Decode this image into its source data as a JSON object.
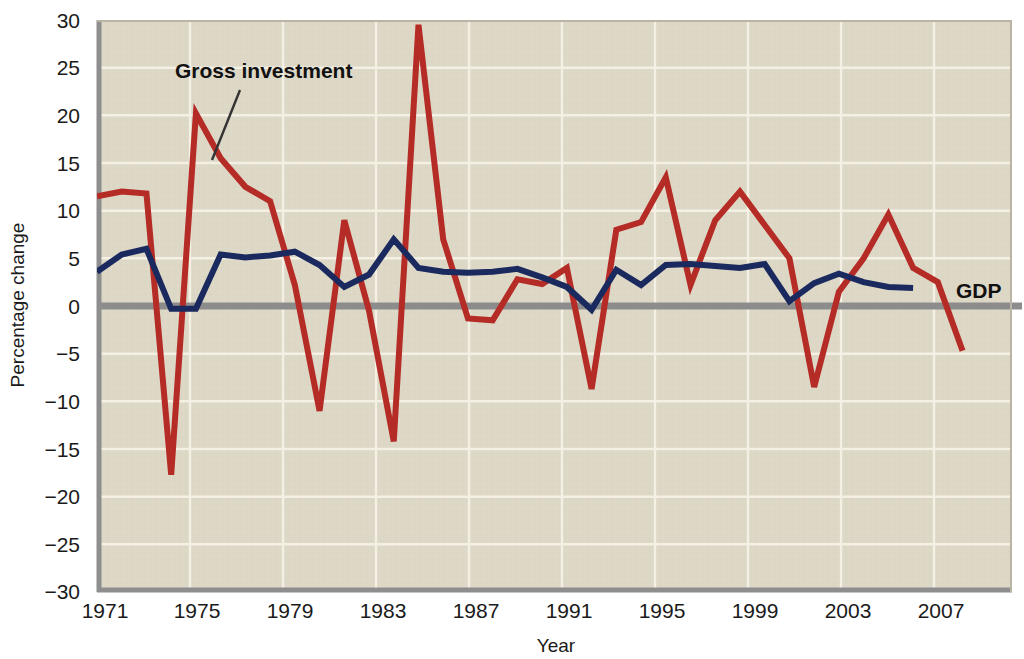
{
  "chart_data": {
    "type": "line",
    "title": "",
    "xlabel": "Year",
    "ylabel": "Percentage change",
    "xlim": [
      1971,
      2008
    ],
    "ylim": [
      -30,
      30
    ],
    "grid": true,
    "legend_position": "inline-annotations",
    "x_ticks": [
      "1971",
      "1975",
      "1979",
      "1983",
      "1987",
      "1991",
      "1995",
      "1999",
      "2003",
      "2007"
    ],
    "y_ticks": [
      "30",
      "25",
      "20",
      "15",
      "10",
      "5",
      "0",
      "−5",
      "−10",
      "−15",
      "−20",
      "−25",
      "−30"
    ],
    "x": [
      1971,
      1972,
      1973,
      1974,
      1975,
      1976,
      1977,
      1978,
      1979,
      1980,
      1981,
      1982,
      1983,
      1984,
      1985,
      1986,
      1987,
      1988,
      1989,
      1990,
      1991,
      1992,
      1993,
      1994,
      1995,
      1996,
      1997,
      1998,
      1999,
      2000,
      2001,
      2002,
      2003,
      2004,
      2005,
      2006,
      2007,
      2008
    ],
    "series": [
      {
        "name": "Gross investment",
        "color": "#b52b26",
        "values": [
          11.5,
          12.0,
          11.8,
          -17.7,
          20.2,
          15.5,
          12.5,
          11.0,
          2.2,
          -11.0,
          9.0,
          -0.5,
          -14.2,
          29.5,
          7.0,
          -1.3,
          -1.5,
          2.8,
          2.3,
          4.0,
          -8.7,
          8.0,
          8.8,
          13.5,
          2.2,
          9.0,
          12.0,
          8.5,
          5.0,
          -8.5,
          1.5,
          5.0,
          9.6,
          4.0,
          2.5,
          -4.7,
          null,
          null
        ]
      },
      {
        "name": "GDP",
        "color": "#1b2a5e",
        "values": [
          3.6,
          5.4,
          6.0,
          -0.3,
          -0.3,
          5.4,
          5.1,
          5.3,
          5.7,
          4.3,
          2.0,
          3.3,
          7.0,
          4.0,
          3.6,
          3.5,
          3.6,
          3.9,
          3.0,
          2.0,
          -0.4,
          3.8,
          2.2,
          4.3,
          4.4,
          4.2,
          4.0,
          4.4,
          0.5,
          2.4,
          3.4,
          2.5,
          2.0,
          1.9,
          null,
          null,
          null,
          null
        ]
      }
    ],
    "annotations": [
      {
        "name": "gross-investment-label",
        "text": "Gross investment"
      },
      {
        "name": "gdp-label",
        "text": "GDP"
      }
    ],
    "colors": {
      "plot_background": "#ddd7c6",
      "gridline": "#f2eee2",
      "zero_line": "#8c8c8c",
      "frame": "#8e8e8e",
      "gross_investment": "#b52b26",
      "gdp": "#1b2a5e"
    }
  },
  "labels": {
    "y_axis_title": "Percentage change",
    "x_axis_title": "Year",
    "gross_investment": "Gross investment",
    "gdp": "GDP"
  }
}
